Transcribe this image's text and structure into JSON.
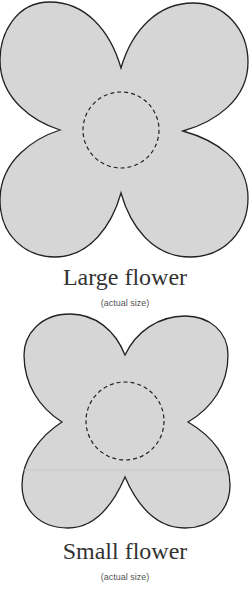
{
  "colors": {
    "fill": "#d6d6d6",
    "stroke": "#222222",
    "text": "#333333",
    "caption": "#555555"
  },
  "large_flower": {
    "label": "Large flower",
    "caption": "(actual size)"
  },
  "small_flower": {
    "label": "Small flower",
    "caption": "(actual size)"
  }
}
